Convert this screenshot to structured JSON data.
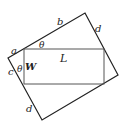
{
  "diagram": {
    "outer_rectangle": {
      "vertices": [
        [
          85,
          13
        ],
        [
          118,
          75
        ],
        [
          42,
          120
        ],
        [
          8,
          58
        ]
      ],
      "stroke": "#222222"
    },
    "inner_rectangle": {
      "x": 24,
      "y": 49,
      "width": 80,
      "height": 35,
      "stroke": "#555555"
    },
    "labels": {
      "a": "a",
      "b": "b",
      "d_top": "d",
      "L": "L",
      "theta_top": "θ",
      "c": "c",
      "theta_left": "θ",
      "W": "W",
      "d_bottom": "d"
    }
  }
}
